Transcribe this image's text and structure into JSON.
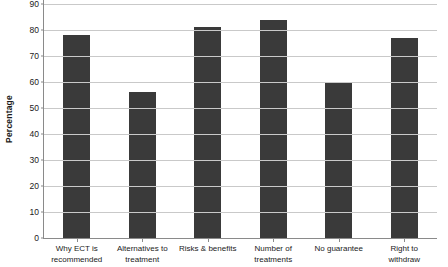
{
  "chart_data": {
    "type": "bar",
    "title": "",
    "xlabel": "",
    "ylabel": "Percentage",
    "ylim": [
      0,
      90
    ],
    "ytick_step": 10,
    "grid": true,
    "legend": "none",
    "bar_color": "#3a3a3a",
    "gridline_color": "#c9c9c9",
    "axis_color": "#8a8a8a",
    "background_color": "#ffffff",
    "categories": [
      "Why ECT is recommended",
      "Alternatives to treatment",
      "Risks & benefits",
      "Number of treatments",
      "No guarantee",
      "Right to withdraw"
    ],
    "category_lines": [
      [
        "Why ECT is",
        "recommended"
      ],
      [
        "Alternatives to",
        "treatment"
      ],
      [
        "Risks & benefits",
        ""
      ],
      [
        "Number of",
        "treatments"
      ],
      [
        "No guarantee",
        ""
      ],
      [
        "Right to",
        "withdraw"
      ]
    ],
    "values": [
      78,
      56,
      81,
      84,
      59.5,
      77
    ],
    "yticks": [
      0,
      10,
      20,
      30,
      40,
      50,
      60,
      70,
      80,
      90
    ],
    "ytick_labels": [
      "0",
      "10",
      "20",
      "30",
      "40",
      "50",
      "60",
      "70",
      "80",
      "90"
    ]
  }
}
